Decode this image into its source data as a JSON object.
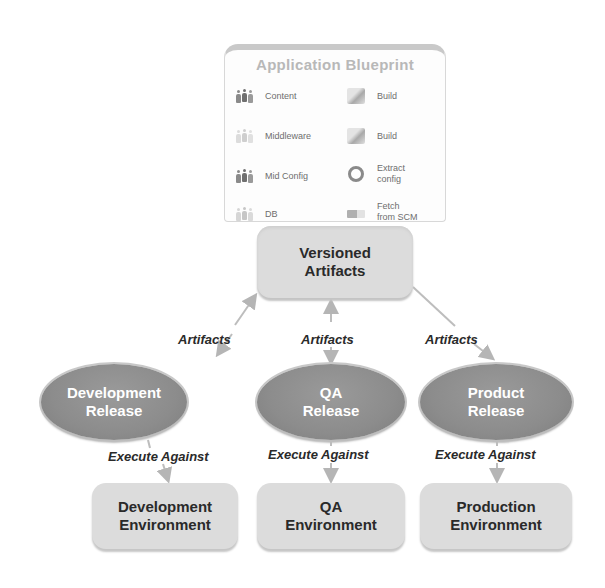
{
  "blueprint": {
    "title": "Application Blueprint",
    "left_items": [
      {
        "label": "Content",
        "icon": "people-icon"
      },
      {
        "label": "Middleware",
        "icon": "people-icon"
      },
      {
        "label": "Mid Config",
        "icon": "people-icon"
      },
      {
        "label": "DB",
        "icon": "people-icon"
      }
    ],
    "right_items": [
      {
        "label": "Build",
        "icon": "build-icon"
      },
      {
        "label": "Build",
        "icon": "build-icon"
      },
      {
        "label_line1": "Extract",
        "label_line2": "config",
        "icon": "gear-icon"
      },
      {
        "label_line1": "Fetch",
        "label_line2": "from SCM",
        "icon": "fetch-icon"
      }
    ]
  },
  "store": {
    "line1": "Versioned",
    "line2": "Artifacts"
  },
  "edges": {
    "artifacts_left": "Artifacts",
    "artifacts_center": "Artifacts",
    "artifacts_right": "Artifacts",
    "execute_left": "Execute Against",
    "execute_center": "Execute Against",
    "execute_right": "Execute Against"
  },
  "releases": [
    {
      "line1": "Development",
      "line2": "Release"
    },
    {
      "line1": "QA",
      "line2": "Release"
    },
    {
      "line1": "Product",
      "line2": "Release"
    }
  ],
  "environments": [
    {
      "line1": "Development",
      "line2": "Environment"
    },
    {
      "line1": "QA",
      "line2": "Environment"
    },
    {
      "line1": "Production",
      "line2": "Environment"
    }
  ],
  "colors": {
    "box_fill": "#dcdcdc",
    "ellipse_fill": "#8c8c8c",
    "arrow": "#b5b5b5"
  }
}
